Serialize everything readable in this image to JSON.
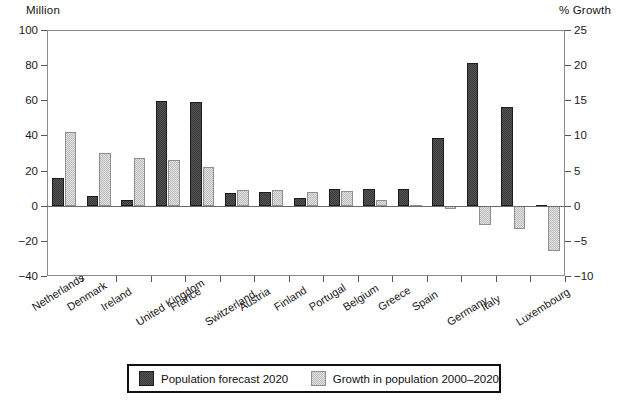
{
  "chart_data": {
    "type": "bar",
    "title": "",
    "subtitle": "",
    "ylabel": "Million",
    "ylabel_right": "% Growth",
    "xlabel": "",
    "ylim": [
      -40,
      100
    ],
    "ylim_right": [
      -10,
      25
    ],
    "yticks": [
      -40,
      -20,
      0,
      20,
      40,
      60,
      80,
      100
    ],
    "yticks_right": [
      -10,
      -5,
      0,
      5,
      10,
      15,
      20,
      25
    ],
    "grid": false,
    "legend_position": "bottom",
    "categories": [
      "Netherlands",
      "Denmark",
      "Ireland",
      "United Kingdom",
      "France",
      "Switzerland",
      "Austria",
      "Finland",
      "Portugal",
      "Belgium",
      "Greece",
      "Spain",
      "Germany",
      "Italy",
      "Luxembourg"
    ],
    "series": [
      {
        "name": "Population forecast 2020",
        "axis": "left",
        "unit": "Million",
        "color": "#3a3a3a",
        "values": [
          16,
          5.5,
          3.5,
          59.5,
          59,
          7.5,
          8,
          4.5,
          9.5,
          9.5,
          9.5,
          38.5,
          81,
          56,
          0.5
        ]
      },
      {
        "name": "Growth in population 2000–2020",
        "axis": "right",
        "unit": "% Growth",
        "color": "#bdbdbd",
        "values": [
          10.5,
          7.5,
          6.75,
          6.5,
          5.5,
          2.25,
          2.25,
          2,
          2.1,
          0.75,
          0.1,
          -0.4,
          -2.75,
          -3.25,
          -6.5
        ]
      }
    ],
    "legend": [
      {
        "label": "Population forecast 2020",
        "swatch": "#3a3a3a"
      },
      {
        "label": "Growth in population 2000–2020",
        "swatch": "#bdbdbd"
      }
    ]
  },
  "axes": {
    "left_title": "Million",
    "right_title": "% Growth",
    "left_ticks": [
      "100",
      "80",
      "60",
      "40",
      "20",
      "0",
      "-20",
      "-40"
    ],
    "right_ticks": [
      "25",
      "20",
      "15",
      "10",
      "5",
      "0",
      "-5",
      "-10"
    ]
  }
}
